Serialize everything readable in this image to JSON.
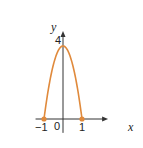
{
  "chart_data": {
    "type": "line",
    "title": "",
    "xlabel": "x",
    "ylabel": "y",
    "function": "y = 4 - 4x^2",
    "xlim": [
      -1.55,
      1.9
    ],
    "ylim": [
      -0.65,
      4.6
    ],
    "x_ticks": [
      {
        "value": -1,
        "label": "−1"
      },
      {
        "value": 0,
        "label": "0"
      },
      {
        "value": 1,
        "label": "1"
      }
    ],
    "y_ticks": [
      {
        "value": 4,
        "label": "4"
      }
    ],
    "series": [
      {
        "name": "parabola",
        "color": "#e08a3c",
        "x": [
          -1,
          -0.75,
          -0.5,
          -0.25,
          0,
          0.25,
          0.5,
          0.75,
          1
        ],
        "y": [
          0,
          1.75,
          3,
          3.75,
          4,
          3.75,
          3,
          1.75,
          0
        ]
      }
    ],
    "points": [
      {
        "x": -1,
        "y": 0
      },
      {
        "x": 1,
        "y": 0
      }
    ],
    "grid": false,
    "legend": "none"
  }
}
